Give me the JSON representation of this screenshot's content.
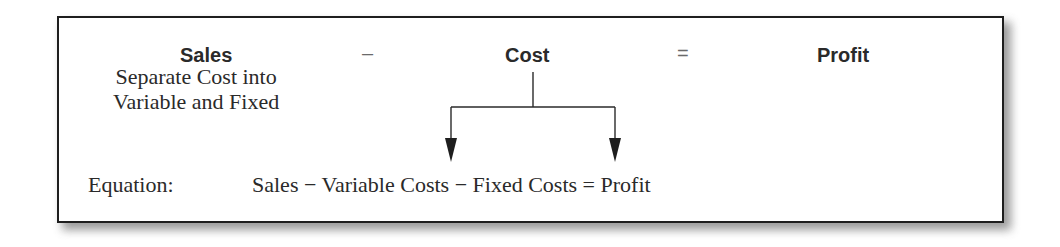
{
  "diagram": {
    "header": {
      "left_term": "Sales",
      "operator_minus": "–",
      "middle_term": "Cost",
      "operator_equals": "=",
      "right_term": "Profit"
    },
    "note": {
      "line1": "Separate Cost into",
      "line2": "Variable and Fixed"
    },
    "split_arrows": {
      "from": "Cost",
      "targets": [
        "Variable Costs",
        "Fixed Costs"
      ]
    },
    "equation": {
      "label": "Equation:",
      "text": "Sales − Variable Costs − Fixed Costs = Profit"
    },
    "colors": {
      "border": "#1e1e1e",
      "text": "#2a2a2a",
      "operator": "#6a6a6a",
      "background": "#ffffff",
      "shadow": "#8a8a8a"
    }
  }
}
